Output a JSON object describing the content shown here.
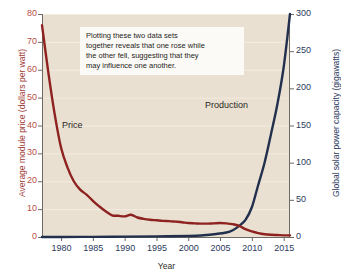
{
  "chart_data": {
    "type": "line",
    "title": "",
    "xlabel": "Year",
    "xlim": [
      1977,
      2016
    ],
    "xticks": [
      1980,
      1985,
      1990,
      1995,
      2000,
      2005,
      2010,
      2015
    ],
    "grid": true,
    "legend_position": "inline-annotations",
    "annotations": [
      "Plotting these two data sets together reveals that one rose while the other fell, suggesting that they may influence one another."
    ],
    "axes": [
      {
        "side": "left",
        "label": "Average module price (dollars per watt)",
        "color": "#9e3b36",
        "ylim": [
          0,
          80
        ],
        "yticks": [
          0,
          10,
          20,
          30,
          40,
          50,
          60,
          70,
          80
        ]
      },
      {
        "side": "right",
        "label": "Global solar power capacity (gigawatts)",
        "color": "#2b3a5c",
        "ylim": [
          0,
          300
        ],
        "yticks": [
          0,
          50,
          100,
          150,
          200,
          250,
          300
        ]
      }
    ],
    "series": [
      {
        "name": "Price",
        "axis": "left",
        "color": "#8e2220",
        "units": "dollars per watt",
        "x": [
          1977,
          1978,
          1979,
          1980,
          1981,
          1982,
          1983,
          1984,
          1985,
          1986,
          1987,
          1988,
          1989,
          1990,
          1991,
          1992,
          1993,
          1994,
          1995,
          1996,
          1997,
          1998,
          1999,
          2000,
          2001,
          2002,
          2003,
          2004,
          2005,
          2006,
          2007,
          2008,
          2009,
          2010,
          2011,
          2012,
          2013,
          2014,
          2015,
          2016
        ],
        "values": [
          76.0,
          59.0,
          44.0,
          32.0,
          25.0,
          20.0,
          17.0,
          15.2,
          13.0,
          11.0,
          9.2,
          7.8,
          7.6,
          7.4,
          8.0,
          7.0,
          6.5,
          6.2,
          6.0,
          5.8,
          5.7,
          5.5,
          5.3,
          5.0,
          4.9,
          4.8,
          4.8,
          4.9,
          5.0,
          4.9,
          4.6,
          4.0,
          2.8,
          2.0,
          1.4,
          1.0,
          0.8,
          0.7,
          0.6,
          0.6
        ]
      },
      {
        "name": "Production",
        "axis": "right",
        "color": "#22304e",
        "units": "gigawatts",
        "x": [
          1977,
          1980,
          1985,
          1990,
          1995,
          2000,
          2002,
          2004,
          2006,
          2007,
          2008,
          2009,
          2010,
          2011,
          2012,
          2013,
          2014,
          2015,
          2016
        ],
        "values": [
          0.0,
          0.1,
          0.2,
          0.5,
          0.8,
          1.4,
          2.0,
          3.7,
          6.0,
          9.0,
          15.0,
          23.0,
          40.0,
          70.0,
          100.0,
          138.0,
          178.0,
          228.0,
          300.0
        ]
      }
    ]
  },
  "labels": {
    "price_label": "Price",
    "production_label": "Production",
    "x_axis_title": "Year",
    "left_axis_title": "Average module price (dollars per watt)",
    "right_axis_title": "Global solar power capacity (gigawatts)",
    "note_line1": "Plotting these two data sets",
    "note_line2": "together reveals that one rose while",
    "note_line3": "the other fell, suggesting that they",
    "note_line4": "may influence one another."
  },
  "colors": {
    "plot_background": "#e9e0d1",
    "page_background": "#ffffff",
    "price": "#8e2220",
    "production": "#22304e",
    "gridline": "#f3ece0"
  }
}
